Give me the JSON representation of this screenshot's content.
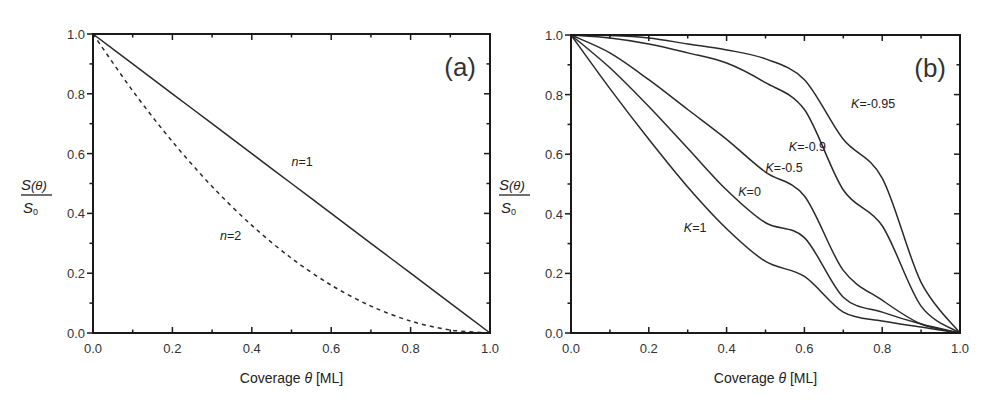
{
  "chart_data": [
    {
      "panel": "(a)",
      "type": "line",
      "xlabel": "Coverage θ [ML]",
      "ylabel": "S(θ)/S0",
      "xlim": [
        0.0,
        1.0
      ],
      "ylim": [
        0.0,
        1.0
      ],
      "xticks": [
        "0.0",
        "0.2",
        "0.4",
        "0.6",
        "0.8",
        "1.0"
      ],
      "yticks": [
        "0.0",
        "0.2",
        "0.4",
        "0.6",
        "0.8",
        "1.0"
      ],
      "grid": false,
      "legend": "inline labels",
      "x": [
        0.0,
        0.1,
        0.2,
        0.3,
        0.4,
        0.5,
        0.6,
        0.7,
        0.8,
        0.9,
        1.0
      ],
      "series": [
        {
          "name": "n=1",
          "style": "solid",
          "values": [
            1.0,
            0.9,
            0.8,
            0.7,
            0.6,
            0.5,
            0.4,
            0.3,
            0.2,
            0.1,
            0.0
          ],
          "label_pos": [
            0.5,
            0.56
          ]
        },
        {
          "name": "n=2",
          "style": "dashed",
          "values": [
            1.0,
            0.81,
            0.64,
            0.49,
            0.36,
            0.25,
            0.16,
            0.09,
            0.04,
            0.01,
            0.0
          ],
          "label_pos": [
            0.32,
            0.31
          ]
        }
      ]
    },
    {
      "panel": "(b)",
      "type": "line",
      "xlabel": "Coverage θ [ML]",
      "ylabel": "S(θ)/S0",
      "xlim": [
        0.0,
        1.0
      ],
      "ylim": [
        0.0,
        1.0
      ],
      "xticks": [
        "0.0",
        "0.2",
        "0.4",
        "0.6",
        "0.8",
        "1.0"
      ],
      "yticks": [
        "0.0",
        "0.2",
        "0.4",
        "0.6",
        "0.8",
        "1.0"
      ],
      "grid": false,
      "legend": "inline labels",
      "x": [
        0.0,
        0.1,
        0.2,
        0.3,
        0.4,
        0.5,
        0.6,
        0.7,
        0.8,
        0.9,
        1.0
      ],
      "series": [
        {
          "name": "K=1",
          "style": "solid",
          "values": [
            1.0,
            0.82,
            0.65,
            0.49,
            0.35,
            0.24,
            0.19,
            0.07,
            0.04,
            0.02,
            0.0
          ],
          "label_pos": [
            0.29,
            0.34
          ]
        },
        {
          "name": "K=0",
          "style": "solid",
          "values": [
            1.0,
            0.89,
            0.76,
            0.62,
            0.48,
            0.37,
            0.32,
            0.12,
            0.07,
            0.03,
            0.0
          ],
          "label_pos": [
            0.43,
            0.46
          ]
        },
        {
          "name": "K=-0.5",
          "style": "solid",
          "values": [
            1.0,
            0.94,
            0.85,
            0.75,
            0.65,
            0.54,
            0.46,
            0.21,
            0.11,
            0.03,
            0.0
          ],
          "label_pos": [
            0.5,
            0.54
          ]
        },
        {
          "name": "K=-0.9",
          "style": "solid",
          "values": [
            1.0,
            0.99,
            0.97,
            0.94,
            0.906,
            0.84,
            0.75,
            0.48,
            0.36,
            0.09,
            0.0
          ],
          "label_pos": [
            0.56,
            0.61
          ]
        },
        {
          "name": "K=-0.95",
          "style": "solid",
          "values": [
            1.0,
            0.998,
            0.99,
            0.97,
            0.95,
            0.92,
            0.85,
            0.65,
            0.52,
            0.17,
            0.0
          ],
          "label_pos": [
            0.72,
            0.755
          ]
        }
      ]
    }
  ],
  "figure": {
    "panels": [
      {
        "label": "(a)",
        "x_axis_title": "Coverage θ [ML]",
        "y_axis_num": "S(θ)",
        "y_axis_den": "S0"
      },
      {
        "label": "(b)",
        "x_axis_title": "Coverage θ [ML]",
        "y_axis_num": "S(θ)",
        "y_axis_den": "S0"
      }
    ],
    "line_color": "#2a2a2a",
    "axis_color": "#1a1a1a"
  }
}
